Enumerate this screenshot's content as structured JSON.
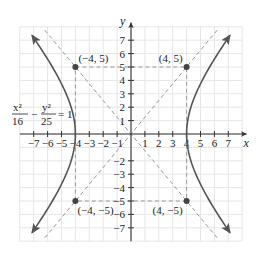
{
  "chart_data": {
    "type": "line",
    "title": "",
    "equation": {
      "lhs_term1_num": "x²",
      "lhs_term1_den": "16",
      "minus": "−",
      "lhs_term2_num": "y²",
      "lhs_term2_den": "25",
      "rhs": "= 1"
    },
    "xlabel": "x",
    "ylabel": "y",
    "xlim": [
      -8,
      8
    ],
    "ylim": [
      -8,
      8
    ],
    "grid": true,
    "x_ticks": [
      "−7",
      "−6",
      "−5",
      "−4",
      "−3",
      "−2",
      "−1",
      "1",
      "2",
      "3",
      "4",
      "5",
      "6",
      "7"
    ],
    "y_ticks": [
      "7",
      "6",
      "5",
      "4",
      "3",
      "2",
      "1",
      "−2",
      "−3",
      "−4",
      "−5",
      "−6",
      "−7"
    ],
    "series": [
      {
        "name": "hyperbola right branch",
        "style": "solid",
        "a": 4,
        "b": 5,
        "branch": "right"
      },
      {
        "name": "hyperbola left branch",
        "style": "solid",
        "a": 4,
        "b": 5,
        "branch": "left"
      },
      {
        "name": "asymptote y = 5/4 x",
        "style": "dashed",
        "slope": 1.25
      },
      {
        "name": "asymptote y = -5/4 x",
        "style": "dashed",
        "slope": -1.25
      },
      {
        "name": "fundamental rectangle",
        "style": "dashed",
        "corners": [
          [
            -4,
            5
          ],
          [
            4,
            5
          ],
          [
            4,
            -5
          ],
          [
            -4,
            -5
          ]
        ]
      }
    ],
    "points": [
      {
        "x": -4,
        "y": 5,
        "label": "(−4, 5)"
      },
      {
        "x": 4,
        "y": 5,
        "label": "(4, 5)"
      },
      {
        "x": -4,
        "y": -5,
        "label": "(−4, −5)"
      },
      {
        "x": 4,
        "y": -5,
        "label": "(4, −5)"
      }
    ],
    "colors": {
      "curve": "#555555",
      "dashed": "#999999",
      "grid": "#e6e6e6",
      "axis": "#333333",
      "point": "#444444"
    }
  }
}
